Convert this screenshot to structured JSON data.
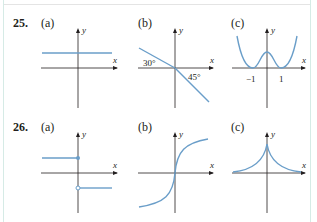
{
  "problems": [
    {
      "number": "25.",
      "parts": [
        {
          "label": "(a)",
          "description": "horizontal line above x-axis"
        },
        {
          "label": "(b)",
          "description": "decreasing line through origin",
          "annotations": [
            "30°",
            "45°"
          ]
        },
        {
          "label": "(c)",
          "description": "W-shaped curve touching x-axis at -1 and 1",
          "ticks": [
            "−1",
            "1"
          ]
        }
      ]
    },
    {
      "number": "26.",
      "parts": [
        {
          "label": "(a)",
          "description": "step function, closed dot above, open dot below at x=0"
        },
        {
          "label": "(b)",
          "description": "S-shaped increasing curve with vertical tangent at origin"
        },
        {
          "label": "(c)",
          "description": "cusp at y-axis, decaying toward x-axis both sides"
        }
      ]
    }
  ],
  "axis": {
    "x": "x",
    "y": "y"
  },
  "colors": {
    "curve": "#6a9ec9",
    "axis": "#231f20",
    "frame": "#d6ebe6"
  }
}
